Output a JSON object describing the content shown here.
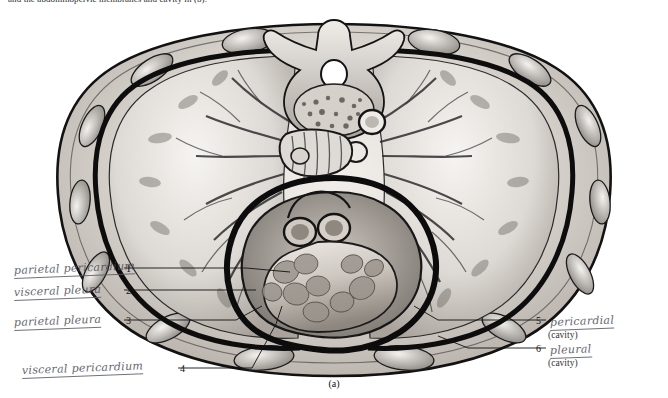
{
  "page": {
    "top_caption": "and the abdominopelvic membranes and cavity in (b).",
    "figure_label": "(a)"
  },
  "annotations": {
    "left": [
      {
        "num": "1",
        "text": "parietal pericardium"
      },
      {
        "num": "2",
        "text": "visceral pleura"
      },
      {
        "num": "3",
        "text": "parietal pleura"
      },
      {
        "num": "4",
        "text": "visceral pericardium"
      }
    ],
    "right": [
      {
        "num": "5",
        "text": "pericardial",
        "sub": "(cavity)"
      },
      {
        "num": "6",
        "text": "pleural",
        "sub": "(cavity)"
      }
    ]
  },
  "colors": {
    "ink": "#1a1a1a",
    "pencil": "#4a4a52",
    "paper": "#ffffff",
    "tissue_light": "#e8e4df",
    "tissue_mid": "#b9b3ac",
    "tissue_dark": "#6e6862",
    "outline": "#111111"
  }
}
